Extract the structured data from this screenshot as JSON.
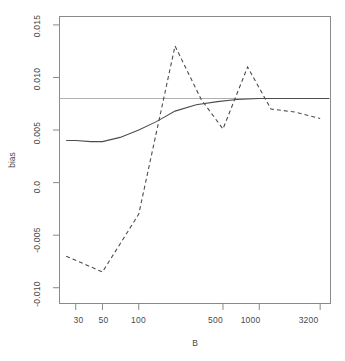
{
  "chart_data": {
    "type": "line",
    "title": "",
    "xlabel": "B",
    "ylabel": "bias",
    "xscale": "log",
    "xlim": [
      22,
      3900
    ],
    "ylim": [
      -0.0115,
      0.0158
    ],
    "grid": false,
    "legend": "none",
    "xticks": [
      30,
      50,
      100,
      500,
      1000,
      3200
    ],
    "xtick_labels": [
      "30",
      "50",
      "100",
      "500",
      "1000",
      "3200"
    ],
    "yticks": [
      0.015,
      0.01,
      0.005,
      0.0,
      -0.005,
      -0.01
    ],
    "ytick_labels": [
      "0.015",
      "0.010",
      "0.005",
      "0.0",
      "-0.005",
      "-0.010"
    ],
    "annotations": [
      {
        "name": "reference-line",
        "kind": "horizontal-line",
        "y": 0.008,
        "style": "solid",
        "color": "#b0b0b0"
      }
    ],
    "series": [
      {
        "name": "solid-curve",
        "style": "solid",
        "color": "#4d4d4d",
        "x": [
          25,
          30,
          40,
          50,
          70,
          100,
          140,
          200,
          300,
          450,
          650,
          1000,
          1500,
          2200,
          3200,
          3800
        ],
        "y": [
          0.004,
          0.004,
          0.0039,
          0.0039,
          0.0043,
          0.005,
          0.0058,
          0.0068,
          0.0074,
          0.0077,
          0.0079,
          0.008,
          0.008,
          0.008,
          0.008,
          0.008
        ]
      },
      {
        "name": "dashed-curve",
        "style": "dashed",
        "color": "#4d4d4d",
        "x": [
          25,
          50,
          100,
          200,
          330,
          500,
          800,
          1250,
          2000,
          3200
        ],
        "y": [
          -0.007,
          -0.0085,
          -0.003,
          0.013,
          0.0079,
          0.0051,
          0.011,
          0.007,
          0.0067,
          0.0061
        ]
      }
    ]
  },
  "axes": {
    "x_title": "B",
    "y_title": "bias"
  }
}
